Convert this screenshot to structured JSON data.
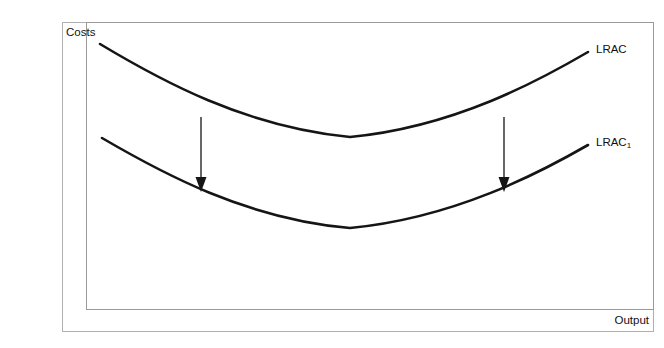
{
  "diagram": {
    "title_axis_y": "Costs",
    "title_axis_x": "Output",
    "curves": [
      {
        "id": "lrac",
        "label": "LRAC",
        "label_base": "LRAC",
        "label_sub": "",
        "path": "M 100 44 C 160 80, 245 127, 350 137 C 455 127, 540 80, 588 52",
        "color": "#151515"
      },
      {
        "id": "lrac1",
        "label": "LRAC1",
        "label_base": "LRAC",
        "label_sub": "1",
        "path": "M 102 138 C 162 173, 246 219, 350 228 C 455 218, 541 172, 588 145",
        "color": "#151515"
      }
    ],
    "arrows": [
      {
        "id": "shift-arrow-left",
        "x": 201,
        "y_start": 117,
        "y_end": 192
      },
      {
        "id": "shift-arrow-right",
        "x": 504,
        "y_start": 117,
        "y_end": 192
      }
    ]
  },
  "chart_data": {
    "type": "line",
    "title": "",
    "xlabel": "Output",
    "ylabel": "Costs",
    "grid": false,
    "legend": "inline-right-labels",
    "annotations": [
      "Downward arrow at left showing LRAC shifting down to LRAC1",
      "Downward arrow at right showing LRAC shifting down to LRAC1"
    ],
    "series": [
      {
        "name": "LRAC",
        "description": "U-shaped long-run average cost curve (upper)",
        "x": [
          100,
          160,
          220,
          280,
          350,
          420,
          480,
          540,
          588
        ],
        "y": [
          44,
          82,
          108,
          127,
          137,
          129,
          111,
          80,
          52
        ]
      },
      {
        "name": "LRAC1",
        "description": "U-shaped long-run average cost curve after downward shift (lower)",
        "x": [
          102,
          162,
          222,
          282,
          350,
          420,
          480,
          541,
          588
        ],
        "y": [
          138,
          175,
          201,
          219,
          228,
          220,
          202,
          172,
          145
        ]
      }
    ]
  }
}
